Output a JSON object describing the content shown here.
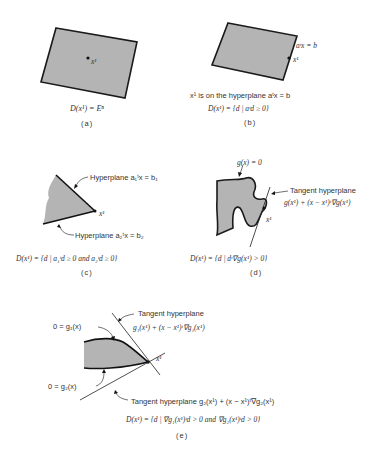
{
  "panels": {
    "a": {
      "point_label": "x¹",
      "formula": "D(x¹) = Eⁿ",
      "caption": "(a)"
    },
    "b": {
      "edge_label": "aᵗx = b",
      "point_label": "x¹",
      "statement": "x¹ is on the hyperplane aᵗx = b",
      "formula": "D(x¹) = {d | aᵗd ≥ 0}",
      "caption": "(b)"
    },
    "c": {
      "hyperplane1_label": "Hyperplane a₁ᵗx = b₁",
      "hyperplane2_label": "Hyperplane a₂ᵗx = b₂",
      "point_label": "x¹",
      "formula": "D(x¹) = {d | a₁ᵗd ≥ 0 and a₂ᵗd ≥ 0}",
      "caption": "(c)"
    },
    "d": {
      "constraint_label": "g(x) = 0",
      "tangent_label": "Tangent hyperplane",
      "tangent_formula": "g(x¹) + (x − x¹)ᵗ∇g(x¹)",
      "point_label": "x¹",
      "formula": "D(x¹) = {d | dᵗ∇g(x¹) > 0}",
      "caption": "(d)"
    },
    "e": {
      "constraint1_label": "0 = g₁(x)",
      "constraint2_label": "0 = g₂(x)",
      "tangent1_label": "Tangent hyperplane",
      "tangent1_formula": "g₁(x¹) + (x − x¹)ᵗ∇g₁(x¹)",
      "tangent2_label": "Tangent hyperplane  g₂(x¹) + (x − x¹)ᵗ∇g₂(x¹)",
      "point_label": "x¹",
      "formula": "D(x¹) = {d | ∇g₁(x¹)ᵗd > 0 and ∇g₂(x¹)ᵗd > 0}",
      "caption": "(e)"
    }
  },
  "colors": {
    "region_fill": "#b4b4b4",
    "stroke": "#1a1a1a",
    "text": "#333333"
  }
}
